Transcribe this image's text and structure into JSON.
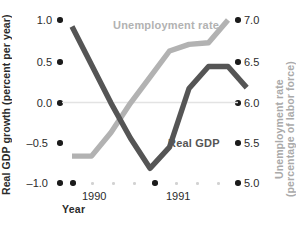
{
  "chart_data": {
    "type": "line",
    "title": "",
    "xlabel": "Year",
    "grid": "zero-line-only",
    "legend": "inline-labels",
    "x_tick_labels": [
      "1990",
      "1991"
    ],
    "axes": {
      "left": {
        "label": "Real GDP growth (percent per year)",
        "ticks": [
          "1.0",
          "0.5",
          "0.0",
          "–0.5",
          "–1.0"
        ],
        "tick_values": [
          1.0,
          0.5,
          0.0,
          -0.5,
          -1.0
        ],
        "ylim": [
          -1.0,
          1.0
        ],
        "color": "#2b2b2b"
      },
      "right": {
        "label": "Unemployment rate\n(percentage of labor force)",
        "ticks": [
          "7.0",
          "6.5",
          "6.0",
          "5.5",
          "5.0"
        ],
        "tick_values": [
          7.0,
          6.5,
          6.0,
          5.5,
          5.0
        ],
        "ylim": [
          5.0,
          7.0
        ],
        "color": "#aaaaaa"
      }
    },
    "series": [
      {
        "name": "Real GDP",
        "axis": "left",
        "color": "#555555",
        "x": [
          0.0,
          0.125,
          0.25,
          0.375,
          0.5,
          0.625,
          0.75,
          0.875,
          1.0
        ],
        "values": [
          0.92,
          0.45,
          -0.02,
          -0.45,
          -0.82,
          -0.56,
          0.16,
          0.43,
          0.43
        ],
        "values_tail": [
          0.43,
          0.17
        ]
      },
      {
        "name": "Unemployment rate",
        "axis": "right",
        "color": "#b2b2b2",
        "x": [
          0.0,
          0.125,
          0.25,
          0.375,
          0.5,
          0.625,
          0.75,
          0.875,
          1.0
        ],
        "values": [
          5.33,
          5.33,
          5.62,
          5.98,
          6.3,
          6.62,
          6.7,
          6.72,
          7.0
        ]
      }
    ],
    "annotations": [
      {
        "text": "Unemployment rate",
        "color": "#b2b2b2"
      },
      {
        "text": "Real GDP",
        "color": "#555555"
      }
    ]
  },
  "left_axis": {
    "title": "Real GDP growth (percent per year)",
    "t0": "1.0",
    "t1": "0.5",
    "t2": "0.0",
    "t3": "–0.5",
    "t4": "–1.0"
  },
  "right_axis": {
    "title": "Unemployment rate\n(percentage of labor force)",
    "t0": "7.0",
    "t1": "6.5",
    "t2": "6.0",
    "t3": "5.5",
    "t4": "5.0"
  },
  "x_axis": {
    "title": "Year",
    "label_1990": "1990",
    "label_1991": "1991"
  },
  "labels": {
    "unemployment": "Unemployment rate",
    "real_gdp": "Real GDP"
  },
  "caption": ""
}
